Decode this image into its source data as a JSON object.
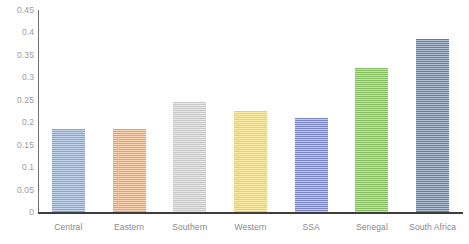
{
  "chart_data": {
    "type": "bar",
    "title": "",
    "subtitle": "",
    "xlabel": "",
    "ylabel": "",
    "categories": [
      "Central",
      "Eastern",
      "Southern",
      "Western",
      "SSA",
      "Senegal",
      "South Africa"
    ],
    "values": [
      0.185,
      0.185,
      0.245,
      0.225,
      0.21,
      0.32,
      0.385
    ],
    "colors": [
      "#7CA6D8",
      "#F0A057",
      "#C9C9C9",
      "#F5D33C",
      "#7B85C0",
      "#85BB61",
      "#5C7FA8"
    ],
    "ylim": [
      0,
      0.45
    ],
    "ytick_labels": [
      "0.45",
      "0.4",
      "0.35",
      "0.3",
      "0.25",
      "0.2",
      "0.15",
      "0.1",
      "0.05",
      "0"
    ],
    "ytick_values": [
      0.45,
      0.4,
      0.35,
      0.3,
      0.25,
      0.2,
      0.15,
      0.1,
      0.05,
      0
    ],
    "grid": false,
    "legend": "none",
    "axis_color": "#6f6f6f",
    "baseline_color": "#3d3d3d",
    "tick_label_color": "#9b9b9b",
    "category_label_color": "#8a8a8a",
    "background": "#ffffff",
    "bar_texture": "horizontal-hatch"
  }
}
